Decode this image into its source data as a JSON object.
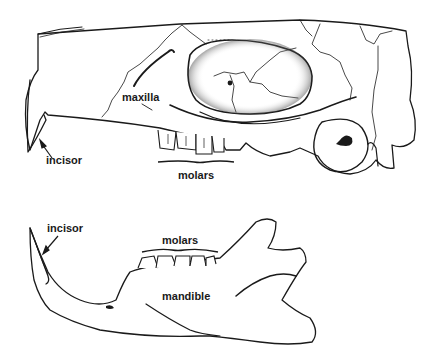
{
  "figure": {
    "skull": {
      "labels": {
        "maxilla": "maxilla",
        "incisor": "incisor",
        "molars": "molars"
      }
    },
    "mandible": {
      "labels": {
        "incisor": "incisor",
        "molars": "molars",
        "mandible": "mandible"
      }
    },
    "colors": {
      "line": "#1a1a1a",
      "background": "#ffffff"
    }
  }
}
